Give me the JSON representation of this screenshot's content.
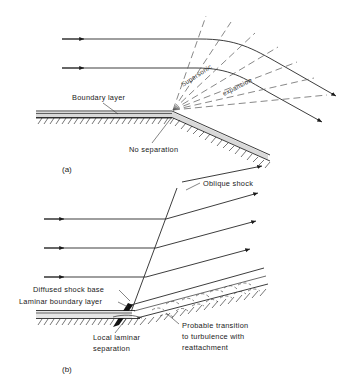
{
  "figure": {
    "type": "technical-diagram",
    "panels": [
      {
        "id": "a",
        "caption": "(a)",
        "labels": [
          {
            "key": "boundary_layer",
            "text": "Boundary layer"
          },
          {
            "key": "no_separation",
            "text": "No separation"
          },
          {
            "key": "supersonic",
            "text": "Supersonic"
          },
          {
            "key": "expansion",
            "text": "expansion"
          }
        ],
        "streamline_count": 2,
        "expansion_fan_lines": 7
      },
      {
        "id": "b",
        "caption": "(b)",
        "labels": [
          {
            "key": "oblique_shock",
            "text": "Oblique shock"
          },
          {
            "key": "diffused_shock_base",
            "text": "Diffused shock base"
          },
          {
            "key": "laminar_boundary_layer",
            "text": "Laminar boundary layer"
          },
          {
            "key": "local_laminar_separation",
            "text": "Local laminar\nseparation"
          },
          {
            "key": "local_laminar_separation_l1",
            "text": "Local laminar"
          },
          {
            "key": "local_laminar_separation_l2",
            "text": "separation"
          },
          {
            "key": "probable_transition",
            "text": "Probable transition\nto turbulence with\nreattachment"
          },
          {
            "key": "probable_transition_l1",
            "text": "Probable transition"
          },
          {
            "key": "probable_transition_l2",
            "text": "to turbulence with"
          },
          {
            "key": "probable_transition_l3",
            "text": "reattachment"
          }
        ],
        "streamline_count": 3,
        "eddy_count": 12
      }
    ],
    "colors": {
      "ink": "#1a1a1a",
      "dashed_wave": "#555555",
      "boundary_layer_fill": "#d9d9d9",
      "shock_base_fill": "#111111",
      "background": "#ffffff"
    }
  }
}
